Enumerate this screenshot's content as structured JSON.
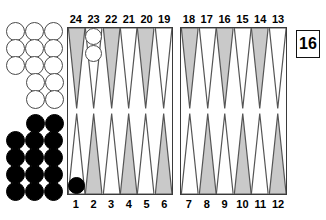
{
  "diagram": {
    "colors": {
      "point_shaded": "#c9c9c9",
      "point_plain": "#ffffff",
      "point_outline": "#555555",
      "board_border": "#3a3a3a",
      "checker_white_fill": "#ffffff",
      "checker_white_edge": "#4a4a4a",
      "checker_black_fill": "#000000"
    }
  },
  "score_box": {
    "value": "16"
  },
  "numbers": {
    "top_left": [
      "24",
      "23",
      "22",
      "21",
      "20",
      "19"
    ],
    "top_right": [
      "18",
      "17",
      "16",
      "15",
      "14",
      "13"
    ],
    "bottom_left": [
      "1",
      "2",
      "3",
      "4",
      "5",
      "6"
    ],
    "bottom_right": [
      "7",
      "8",
      "9",
      "10",
      "11",
      "12"
    ]
  },
  "points": {
    "top_left": [
      {
        "number": "24",
        "shaded": true,
        "checkers": 0,
        "color": ""
      },
      {
        "number": "23",
        "shaded": false,
        "checkers": 2,
        "color": "white"
      },
      {
        "number": "22",
        "shaded": true,
        "checkers": 0,
        "color": ""
      },
      {
        "number": "21",
        "shaded": false,
        "checkers": 0,
        "color": ""
      },
      {
        "number": "20",
        "shaded": true,
        "checkers": 0,
        "color": ""
      },
      {
        "number": "19",
        "shaded": false,
        "checkers": 0,
        "color": ""
      }
    ],
    "top_right": [
      {
        "number": "18",
        "shaded": true,
        "checkers": 0,
        "color": ""
      },
      {
        "number": "17",
        "shaded": false,
        "checkers": 0,
        "color": ""
      },
      {
        "number": "16",
        "shaded": true,
        "checkers": 0,
        "color": ""
      },
      {
        "number": "15",
        "shaded": false,
        "checkers": 0,
        "color": ""
      },
      {
        "number": "14",
        "shaded": true,
        "checkers": 0,
        "color": ""
      },
      {
        "number": "13",
        "shaded": false,
        "checkers": 0,
        "color": ""
      }
    ],
    "bottom_left": [
      {
        "number": "1",
        "shaded": false,
        "checkers": 1,
        "color": "black"
      },
      {
        "number": "2",
        "shaded": true,
        "checkers": 0,
        "color": ""
      },
      {
        "number": "3",
        "shaded": false,
        "checkers": 0,
        "color": ""
      },
      {
        "number": "4",
        "shaded": true,
        "checkers": 0,
        "color": ""
      },
      {
        "number": "5",
        "shaded": false,
        "checkers": 0,
        "color": ""
      },
      {
        "number": "6",
        "shaded": true,
        "checkers": 0,
        "color": ""
      }
    ],
    "bottom_right": [
      {
        "number": "7",
        "shaded": false,
        "checkers": 0,
        "color": ""
      },
      {
        "number": "8",
        "shaded": true,
        "checkers": 0,
        "color": ""
      },
      {
        "number": "9",
        "shaded": false,
        "checkers": 0,
        "color": ""
      },
      {
        "number": "10",
        "shaded": true,
        "checkers": 0,
        "color": ""
      },
      {
        "number": "11",
        "shaded": false,
        "checkers": 0,
        "color": ""
      },
      {
        "number": "12",
        "shaded": true,
        "checkers": 0,
        "color": ""
      }
    ]
  },
  "off_board": {
    "white": {
      "color": "white",
      "total": 13,
      "rows": [
        {
          "count": 3,
          "align": "left"
        },
        {
          "count": 3,
          "align": "left"
        },
        {
          "count": 3,
          "align": "left"
        },
        {
          "count": 2,
          "align": "right"
        },
        {
          "count": 2,
          "align": "right"
        }
      ]
    },
    "black": {
      "color": "black",
      "total": 14,
      "rows": [
        {
          "count": 2,
          "align": "right"
        },
        {
          "count": 3,
          "align": "left"
        },
        {
          "count": 3,
          "align": "left"
        },
        {
          "count": 3,
          "align": "left"
        },
        {
          "count": 3,
          "align": "left"
        }
      ]
    }
  }
}
